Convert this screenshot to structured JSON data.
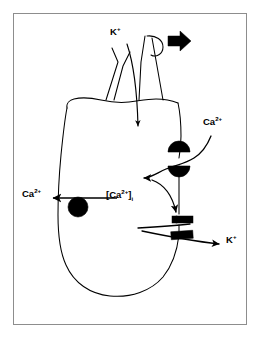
{
  "figure": {
    "border_color": "#8d8d8d",
    "background_color": "#ffffff",
    "ink_color": "#000000",
    "width": 263,
    "height": 341
  },
  "labels": {
    "potassium_apical": {
      "text": "K",
      "charge": "+",
      "full": "K+"
    },
    "calcium_entry": {
      "text": "Ca",
      "charge": "2+",
      "full": "Ca2+"
    },
    "calcium_extrusion": {
      "text": "Ca",
      "charge": "2+",
      "full": "Ca2+"
    },
    "calcium_intracellular": {
      "open_bracket": "[",
      "text": "Ca",
      "charge": "2+",
      "close_bracket": "]",
      "subscript": "i",
      "full": "[Ca2+]i"
    },
    "potassium_basolateral": {
      "text": "K",
      "charge": "+",
      "full": "K+"
    }
  },
  "elements": {
    "stereocilia_bundle": "stereocilia-bundle",
    "tip_link": "tip-link-loop",
    "deflection_arrow": "deflection-arrow",
    "potassium_influx_arrow": "potassium-influx-arrow",
    "calcium_channel": "calcium-channel-receptor",
    "calcium_influx_arrow": "calcium-influx-arrow",
    "calcium_pump": "calcium-extrusion-pump",
    "calcium_extrusion_arrow": "calcium-extrusion-arrow",
    "potassium_channel_upper": "potassium-channel-upper",
    "potassium_channel_lower": "potassium-channel-lower",
    "calcium_activation_arrow": "calcium-activation-arrow",
    "potassium_efflux_arrow": "potassium-efflux-arrow",
    "cell_body": "hair-cell-body"
  }
}
